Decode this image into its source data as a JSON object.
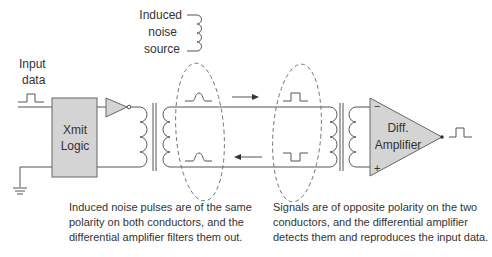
{
  "labels": {
    "input_line1": "Input",
    "input_line2": "data",
    "noise_line1": "Induced",
    "noise_line2": "noise",
    "noise_line3": "source",
    "xmit_line1": "Xmit",
    "xmit_line2": "Logic",
    "amp_line1": "Diff.",
    "amp_line2": "Amplifier",
    "amp_minus": "−",
    "amp_plus": "+"
  },
  "captions": {
    "left": [
      "Induced noise pulses are of the same",
      "polarity on both conductors, and the",
      "differential amplifier filters them out."
    ],
    "right": [
      "Signals are of opposite polarity on the two",
      "conductors, and the differential amplifier",
      "detects them and reproduces the input data."
    ]
  },
  "colors": {
    "stroke": "#555555",
    "fill_box": "#d4d4d4",
    "text": "#333333"
  }
}
